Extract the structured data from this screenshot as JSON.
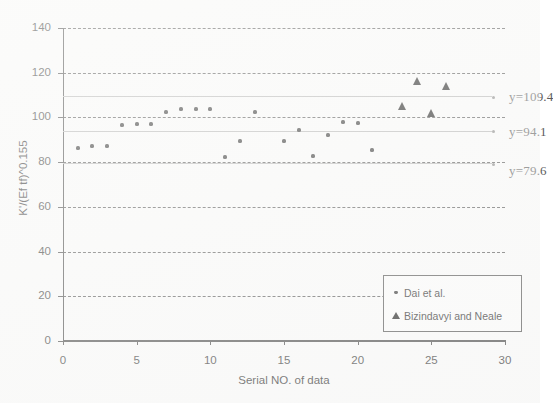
{
  "chart_data": {
    "type": "scatter",
    "title": "",
    "xlabel": "Serial NO. of data",
    "ylabel": "K'/(Ef tf)^0.155",
    "xlim": [
      0,
      30
    ],
    "ylim": [
      0,
      140
    ],
    "xticks": [
      0,
      5,
      10,
      15,
      20,
      25,
      30
    ],
    "yticks": [
      0,
      20,
      40,
      60,
      80,
      100,
      120,
      140
    ],
    "grid": "horizontal-dashed",
    "legend_position": "lower-right",
    "series": [
      {
        "name": "Dai et al.",
        "marker": "diamond",
        "color": "#343434",
        "points": [
          {
            "x": 1,
            "y": 86.5
          },
          {
            "x": 2,
            "y": 87.0
          },
          {
            "x": 3,
            "y": 87.0
          },
          {
            "x": 4,
            "y": 96.5
          },
          {
            "x": 5,
            "y": 97.2
          },
          {
            "x": 6,
            "y": 97.2
          },
          {
            "x": 7,
            "y": 102.5
          },
          {
            "x": 8,
            "y": 103.6
          },
          {
            "x": 9,
            "y": 103.6
          },
          {
            "x": 10,
            "y": 103.6
          },
          {
            "x": 11,
            "y": 82.5
          },
          {
            "x": 12,
            "y": 89.5
          },
          {
            "x": 13,
            "y": 102.6
          },
          {
            "x": 15,
            "y": 89.6
          },
          {
            "x": 16,
            "y": 94.5
          },
          {
            "x": 17,
            "y": 82.6
          },
          {
            "x": 18,
            "y": 92.2
          },
          {
            "x": 19,
            "y": 98.0
          },
          {
            "x": 20,
            "y": 97.5
          },
          {
            "x": 21,
            "y": 85.6
          }
        ]
      },
      {
        "name": "Bizindavyi and Neale",
        "marker": "triangle",
        "color": "#1f1f1f",
        "points": [
          {
            "x": 23,
            "y": 105.0
          },
          {
            "x": 24,
            "y": 116.5
          },
          {
            "x": 25,
            "y": 102.2
          },
          {
            "x": 26,
            "y": 114.0
          }
        ]
      }
    ],
    "reference_lines": [
      {
        "value": 109.4,
        "label": "y=109.4",
        "style": "solid"
      },
      {
        "value": 94.1,
        "label": "y=94.1",
        "style": "solid"
      },
      {
        "value": 79.6,
        "label": "y=79.6",
        "style": "solid"
      }
    ]
  },
  "axes": {
    "x_title": "Serial NO. of data",
    "y_title": "K'/(Ef tf)^0.155",
    "x_tick_labels": [
      "0",
      "5",
      "10",
      "15",
      "20",
      "25",
      "30"
    ],
    "y_tick_labels": [
      "0",
      "20",
      "40",
      "60",
      "80",
      "100",
      "120",
      "140"
    ]
  },
  "reference_labels": {
    "upper": "y=109.4",
    "middle": "y=94.1",
    "lower": "y=79.6"
  },
  "legend": {
    "entries": [
      {
        "label": "Dai et al.",
        "marker": "diamond-marker-icon"
      },
      {
        "label": "Bizindavyi and Neale",
        "marker": "triangle-marker-icon"
      }
    ]
  },
  "colors": {
    "marker_diamond": "#343434",
    "marker_triangle": "#1f1f1f",
    "gridline": "#5a5a5a",
    "reference_line": "#b9b9b9",
    "axis": "#4a4a4a",
    "background": "#fdfdfd"
  }
}
